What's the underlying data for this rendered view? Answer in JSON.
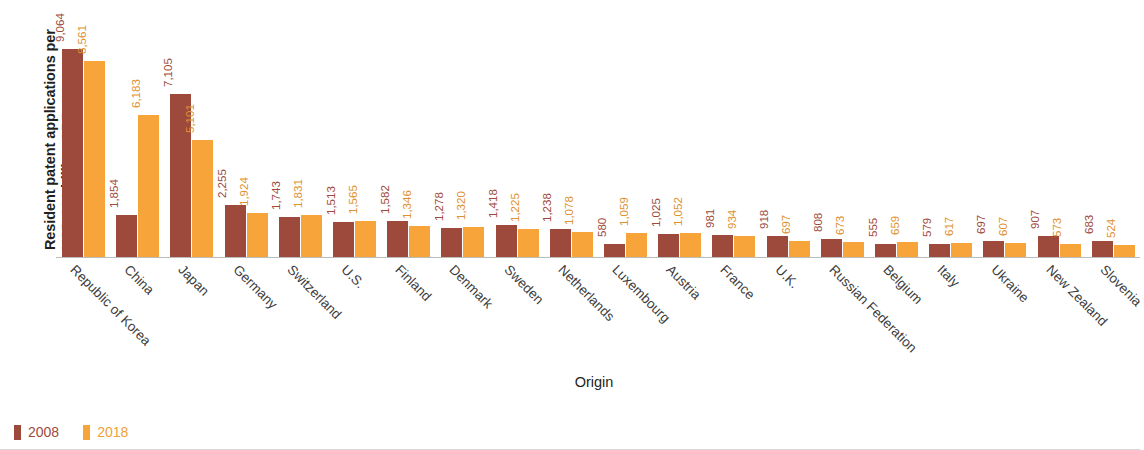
{
  "chart_data": {
    "type": "bar",
    "title": "",
    "xlabel": "Origin",
    "ylabel": "Resident patent applications per USD 100 billion GDP",
    "ylim": [
      0,
      9064
    ],
    "grid": false,
    "legend_position": "bottom-left",
    "categories": [
      "Republic of Korea",
      "China",
      "Japan",
      "Germany",
      "Switzerland",
      "U.S.",
      "Finland",
      "Denmark",
      "Sweden",
      "Netherlands",
      "Luxembourg",
      "Austria",
      "France",
      "U.K.",
      "Russian Federation",
      "Belgium",
      "Italy",
      "Ukraine",
      "New Zealand",
      "Slovenia"
    ],
    "series": [
      {
        "name": "2008",
        "color": "#9d4a3c",
        "values": [
          9064,
          1854,
          7105,
          2255,
          1743,
          1513,
          1582,
          1278,
          1418,
          1238,
          580,
          1025,
          981,
          918,
          808,
          555,
          579,
          697,
          907,
          683
        ],
        "labels": [
          "9,064",
          "1,854",
          "7,105",
          "2,255",
          "1,743",
          "1,513",
          "1,582",
          "1,278",
          "1,418",
          "1,238",
          "580",
          "1,025",
          "981",
          "918",
          "808",
          "555",
          "579",
          "697",
          "907",
          "683"
        ]
      },
      {
        "name": "2018",
        "color": "#f7a43a",
        "values": [
          8561,
          6183,
          5101,
          1924,
          1831,
          1565,
          1346,
          1320,
          1225,
          1078,
          1059,
          1052,
          934,
          697,
          673,
          659,
          617,
          607,
          573,
          524
        ],
        "labels": [
          "8,561",
          "6,183",
          "5,101",
          "1,924",
          "1,831",
          "1,565",
          "1,346",
          "1,320",
          "1,225",
          "1,078",
          "1,059",
          "1,052",
          "934",
          "697",
          "673",
          "659",
          "617",
          "607",
          "573",
          "524"
        ]
      }
    ]
  },
  "legend": {
    "items": [
      {
        "label": "2008",
        "color": "#9d4a3c"
      },
      {
        "label": "2018",
        "color": "#f7a43a"
      }
    ]
  }
}
